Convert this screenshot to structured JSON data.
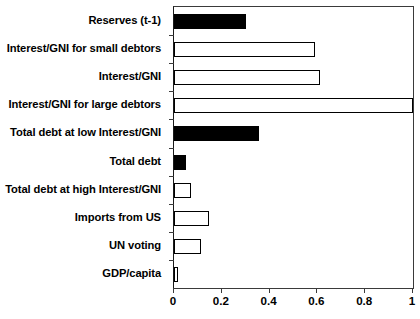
{
  "chart_data": {
    "type": "bar",
    "orientation": "horizontal",
    "title": "",
    "xlabel": "",
    "ylabel": "",
    "xlim": [
      0,
      1
    ],
    "xticks": [
      "0",
      "0.2",
      "0.4",
      "0.6",
      "0.8",
      "1"
    ],
    "xtick_values": [
      0,
      0.2,
      0.4,
      0.6,
      0.8,
      1
    ],
    "grid": false,
    "legend": false,
    "categories": [
      "Reserves (t-1)",
      "Interest/GNI for small debtors",
      "Interest/GNI",
      "Interest/GNI for large debtors",
      "Total debt at low Interest/GNI",
      "Total debt",
      "Total debt at high Interest/GNI",
      "Imports from US",
      "UN voting",
      "GDP/capita"
    ],
    "values": [
      0.3,
      0.59,
      0.61,
      1.0,
      0.355,
      0.05,
      0.072,
      0.148,
      0.112,
      0.015
    ],
    "bar_styles": [
      "filled",
      "outline",
      "outline",
      "outline",
      "filled",
      "filled",
      "outline",
      "outline",
      "outline",
      "outline"
    ],
    "colors": {
      "filled": "#000000",
      "outline_fill": "#ffffff",
      "bar_edge": "#000000",
      "axis": "#3a3a3a",
      "text": "#000000",
      "background": "#ffffff"
    }
  }
}
